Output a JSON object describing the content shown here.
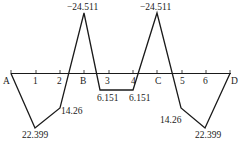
{
  "diagram": {
    "type": "bending-moment-diagram",
    "axis": {
      "points": [
        {
          "label": "A",
          "x": 11
        },
        {
          "label": "1",
          "x": 36
        },
        {
          "label": "2",
          "x": 60
        },
        {
          "label": "B",
          "x": 84
        },
        {
          "label": "3",
          "x": 109
        },
        {
          "label": "4",
          "x": 133
        },
        {
          "label": "C",
          "x": 157
        },
        {
          "label": "5",
          "x": 182
        },
        {
          "label": "6",
          "x": 206
        },
        {
          "label": "D",
          "x": 230
        }
      ]
    },
    "values": {
      "A": "0",
      "p1": "22.399",
      "p2": "14.26",
      "B": "−24.511",
      "p3": "6.151",
      "p4": "6.151",
      "C": "−24.511",
      "p5": "14.26",
      "p6": "22.399",
      "D": "0"
    },
    "labels": {
      "A": "A",
      "p1": "1",
      "p2": "2",
      "B": "B",
      "p3": "3",
      "p4": "4",
      "C": "C",
      "p5": "5",
      "p6": "6",
      "D": "D"
    },
    "line_color": "#1a1a1a"
  }
}
